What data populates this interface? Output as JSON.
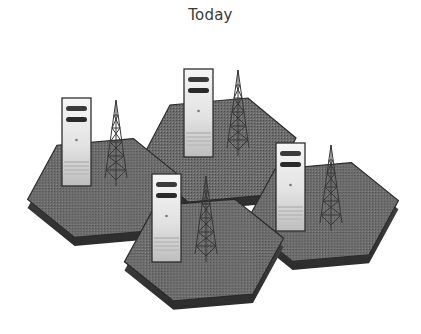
{
  "title": "Today",
  "colors": {
    "background": "#ffffff",
    "hex_top": "#6e6e6e",
    "hex_side": "#3e3e3e",
    "hex_edge": "#2a2a2a",
    "server_body_top": "#f4f4f4",
    "server_body_bottom": "#c8c8c8",
    "server_outline": "#2e2e2e",
    "server_slot": "#2b2b2b",
    "tower": "#3a3a3a"
  },
  "cells": [
    {
      "id": "cell-left",
      "label": "Cell 1",
      "server": "server",
      "antenna": "radio-tower"
    },
    {
      "id": "cell-top",
      "label": "Cell 2",
      "server": "server",
      "antenna": "radio-tower"
    },
    {
      "id": "cell-bottom",
      "label": "Cell 3",
      "server": "server",
      "antenna": "radio-tower"
    },
    {
      "id": "cell-right",
      "label": "Cell 4",
      "server": "server",
      "antenna": "radio-tower"
    }
  ]
}
